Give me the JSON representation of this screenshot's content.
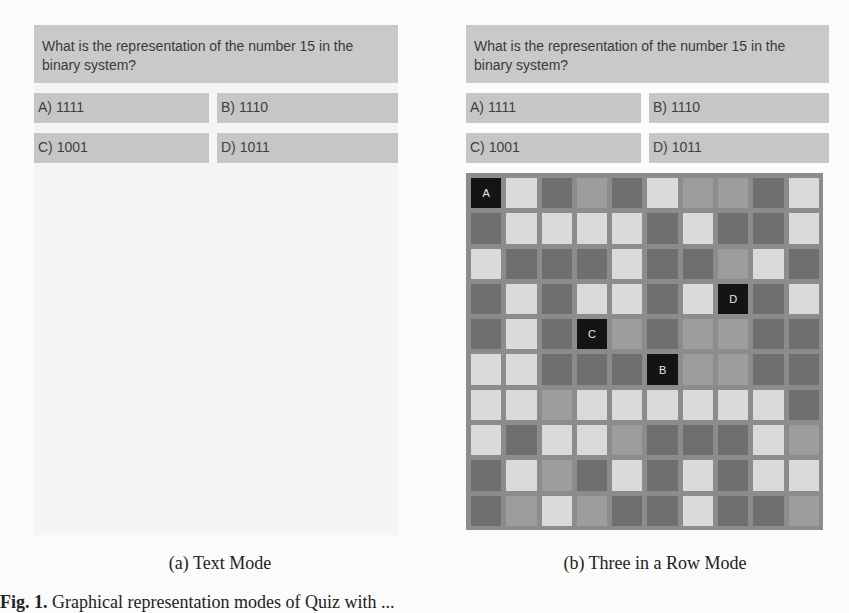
{
  "panel_a": {
    "question": "What is the representation of the number 15 in the binary system?",
    "answers": [
      "A) 1111",
      "B) 1110",
      "C) 1001",
      "D) 1011"
    ],
    "caption": "(a) Text Mode"
  },
  "panel_b": {
    "question": "What is the representation of the number 15 in the binary system?",
    "answers": [
      "A) 1111",
      "B) 1110",
      "C) 1001",
      "D) 1011"
    ],
    "caption": "(b) Three in a Row Mode",
    "grid": {
      "rows": 10,
      "cols": 10,
      "legend": {
        "L": "#dadada",
        "D": "#6f6f6f",
        "M": "#9d9d9d",
        "K": "#141414"
      },
      "cells": [
        [
          "K:A",
          "L",
          "D",
          "M",
          "D",
          "L",
          "M",
          "M",
          "D",
          "L"
        ],
        [
          "D",
          "L",
          "L",
          "L",
          "L",
          "D",
          "L",
          "D",
          "D",
          "L"
        ],
        [
          "L",
          "D",
          "D",
          "D",
          "L",
          "D",
          "D",
          "M",
          "L",
          "D"
        ],
        [
          "D",
          "L",
          "D",
          "L",
          "L",
          "D",
          "L",
          "K:D",
          "D",
          "L"
        ],
        [
          "D",
          "L",
          "D",
          "K:C",
          "M",
          "D",
          "M",
          "M",
          "D",
          "D"
        ],
        [
          "L",
          "L",
          "D",
          "D",
          "D",
          "K:B",
          "M",
          "M",
          "D",
          "D"
        ],
        [
          "L",
          "L",
          "M",
          "L",
          "L",
          "L",
          "L",
          "L",
          "L",
          "D"
        ],
        [
          "L",
          "D",
          "L",
          "L",
          "M",
          "D",
          "D",
          "D",
          "L",
          "M"
        ],
        [
          "D",
          "L",
          "M",
          "D",
          "L",
          "D",
          "L",
          "D",
          "L",
          "L"
        ],
        [
          "D",
          "M",
          "L",
          "M",
          "D",
          "D",
          "L",
          "D",
          "D",
          "M"
        ]
      ]
    }
  },
  "figure_caption": {
    "label": "Fig. 1.",
    "text": "Graphical representation modes of Quiz with ..."
  }
}
